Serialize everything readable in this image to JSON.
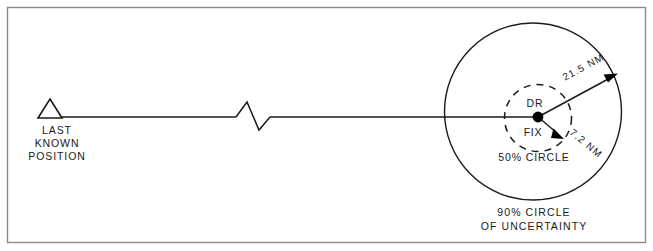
{
  "figure": {
    "title": "90% Circle of Uncertainty",
    "background_color": "#ffffff",
    "ink_color": "#1a1a1a",
    "frame_color": "#8a8a8a"
  },
  "last_known_position": {
    "symbol": "triangle-marker",
    "label_lines": [
      "LAST",
      "KNOWN",
      "POSITION"
    ],
    "line1": "LAST",
    "line2": "KNOWN",
    "line3": "POSITION"
  },
  "track": {
    "break_symbol": "zigzag-break",
    "description": "Track line from last known position to DR fix"
  },
  "fix": {
    "above_label": "DR",
    "below_label": "FIX",
    "dot": "fix-dot"
  },
  "circles": {
    "inner": {
      "label": "50%  CIRCLE",
      "style": "dashed",
      "radius_label": "7.2  NM",
      "radius_value": 7.2,
      "radius_units": "NM",
      "probability": "50%"
    },
    "outer": {
      "caption_line1": "90%  CIRCLE",
      "caption_line2": "OF  UNCERTAINTY",
      "style": "solid",
      "radius_label": "21.5  NM",
      "radius_value": 21.5,
      "radius_units": "NM",
      "probability": "90%"
    }
  }
}
